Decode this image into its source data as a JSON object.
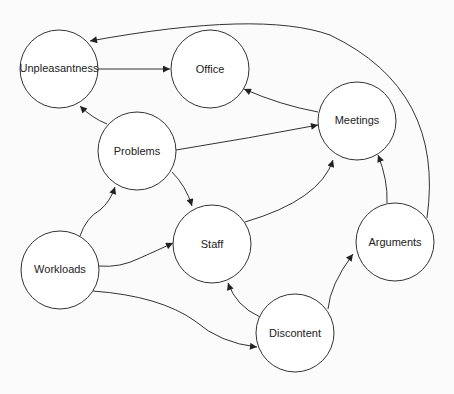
{
  "header": {
    "text": ""
  },
  "diagram": {
    "type": "directed-graph",
    "nodes": [
      {
        "id": "unpleasantness",
        "label": "Unpleasantness",
        "x": 59,
        "y": 69,
        "r": 39
      },
      {
        "id": "office",
        "label": "Office",
        "x": 210,
        "y": 69,
        "r": 39
      },
      {
        "id": "meetings",
        "label": "Meetings",
        "x": 357,
        "y": 121,
        "r": 39
      },
      {
        "id": "problems",
        "label": "Problems",
        "x": 137,
        "y": 151,
        "r": 39
      },
      {
        "id": "staff",
        "label": "Staff",
        "x": 212,
        "y": 244,
        "r": 39
      },
      {
        "id": "arguments",
        "label": "Arguments",
        "x": 395,
        "y": 242,
        "r": 39
      },
      {
        "id": "workloads",
        "label": "Workloads",
        "x": 60,
        "y": 270,
        "r": 39
      },
      {
        "id": "discontent",
        "label": "Discontent",
        "x": 295,
        "y": 333,
        "r": 39
      }
    ],
    "edges": [
      {
        "from": "unpleasantness",
        "to": "office"
      },
      {
        "from": "meetings",
        "to": "office"
      },
      {
        "from": "problems",
        "to": "unpleasantness"
      },
      {
        "from": "problems",
        "to": "meetings"
      },
      {
        "from": "problems",
        "to": "staff"
      },
      {
        "from": "workloads",
        "to": "problems"
      },
      {
        "from": "workloads",
        "to": "staff"
      },
      {
        "from": "workloads",
        "to": "discontent"
      },
      {
        "from": "staff",
        "to": "meetings"
      },
      {
        "from": "discontent",
        "to": "staff"
      },
      {
        "from": "discontent",
        "to": "arguments"
      },
      {
        "from": "arguments",
        "to": "meetings"
      },
      {
        "from": "arguments",
        "to": "unpleasantness"
      }
    ]
  }
}
